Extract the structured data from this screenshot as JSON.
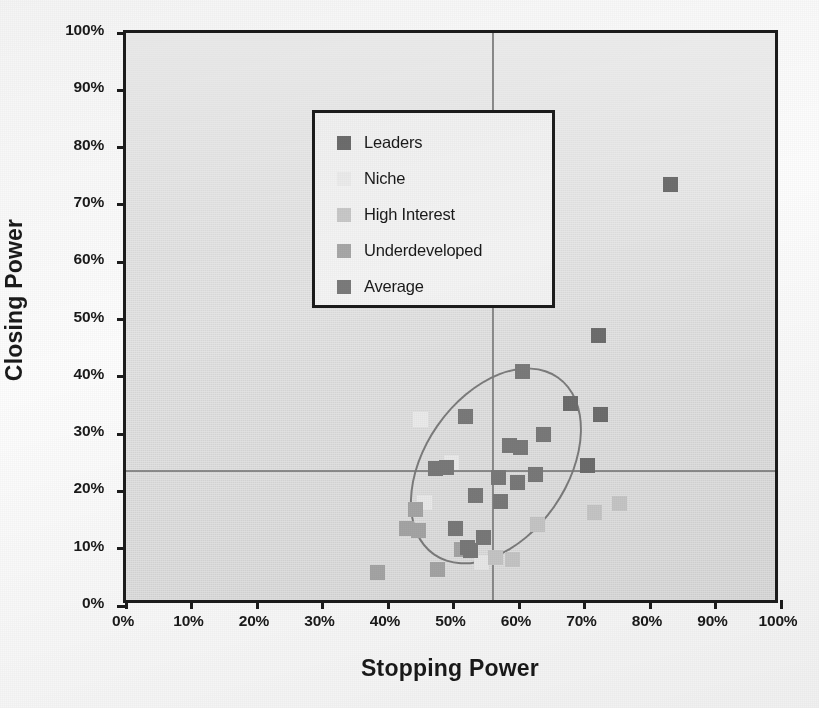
{
  "chart_data": {
    "type": "scatter",
    "title": "",
    "xlabel": "Stopping Power",
    "ylabel": "Closing Power",
    "xlim": [
      0,
      100
    ],
    "ylim": [
      0,
      100
    ],
    "xtick_labels": [
      "0%",
      "10%",
      "20%",
      "30%",
      "40%",
      "50%",
      "60%",
      "70%",
      "80%",
      "90%",
      "100%"
    ],
    "ytick_labels": [
      "0%",
      "10%",
      "20%",
      "30%",
      "40%",
      "50%",
      "60%",
      "70%",
      "80%",
      "90%",
      "100%"
    ],
    "xticks": [
      0,
      10,
      20,
      30,
      40,
      50,
      60,
      70,
      80,
      90,
      100
    ],
    "yticks": [
      0,
      10,
      20,
      30,
      40,
      50,
      60,
      70,
      80,
      90,
      100
    ],
    "grid": false,
    "legend_position": "upper-left-inside",
    "reference_lines": [
      {
        "axis": "vertical",
        "value": 56.0,
        "label": "average stopping power"
      },
      {
        "axis": "horizontal",
        "value": 23.5,
        "label": "average closing power"
      }
    ],
    "annotations": [
      {
        "shape": "ellipse",
        "center_x": 56.5,
        "center_y": 24.5,
        "width": 22.0,
        "height": 38.0,
        "rotation_deg": 35,
        "label": "core cluster highlight"
      }
    ],
    "series": [
      {
        "name": "Leaders",
        "color": "#6e6e6e",
        "points": [
          {
            "x": 60.3,
            "y": 83.8
          },
          {
            "x": 83.2,
            "y": 73.5
          },
          {
            "x": 72.2,
            "y": 47.2
          },
          {
            "x": 67.8,
            "y": 35.3
          },
          {
            "x": 72.4,
            "y": 33.5
          },
          {
            "x": 70.5,
            "y": 24.6
          }
        ]
      },
      {
        "name": "Niche",
        "color": "#ededed",
        "points": [
          {
            "x": 45.0,
            "y": 32.6
          },
          {
            "x": 49.7,
            "y": 25.1
          },
          {
            "x": 45.6,
            "y": 18.1
          },
          {
            "x": 54.2,
            "y": 7.6
          }
        ]
      },
      {
        "name": "High Interest",
        "color": "#c9c9c9",
        "points": [
          {
            "x": 62.8,
            "y": 14.2
          },
          {
            "x": 71.6,
            "y": 16.3
          },
          {
            "x": 75.4,
            "y": 17.9
          },
          {
            "x": 56.4,
            "y": 8.4
          },
          {
            "x": 59.0,
            "y": 8.2
          }
        ]
      },
      {
        "name": "Underdeveloped",
        "color": "#a8a8a8",
        "points": [
          {
            "x": 38.4,
            "y": 5.8
          },
          {
            "x": 42.8,
            "y": 13.6
          },
          {
            "x": 44.2,
            "y": 16.8
          },
          {
            "x": 44.6,
            "y": 13.2
          },
          {
            "x": 47.6,
            "y": 6.3
          },
          {
            "x": 51.2,
            "y": 9.8
          }
        ]
      },
      {
        "name": "Average",
        "color": "#7b7b7b",
        "points": [
          {
            "x": 60.5,
            "y": 41.0
          },
          {
            "x": 51.8,
            "y": 33.0
          },
          {
            "x": 63.8,
            "y": 30.0
          },
          {
            "x": 58.6,
            "y": 28.0
          },
          {
            "x": 60.2,
            "y": 27.6
          },
          {
            "x": 62.5,
            "y": 23.0
          },
          {
            "x": 56.8,
            "y": 22.4
          },
          {
            "x": 59.8,
            "y": 21.5
          },
          {
            "x": 49.0,
            "y": 24.2
          },
          {
            "x": 47.3,
            "y": 24.0
          },
          {
            "x": 53.4,
            "y": 19.2
          },
          {
            "x": 57.1,
            "y": 18.2
          },
          {
            "x": 50.3,
            "y": 13.5
          },
          {
            "x": 54.6,
            "y": 12.0
          },
          {
            "x": 52.2,
            "y": 10.2
          },
          {
            "x": 52.6,
            "y": 9.6
          }
        ]
      }
    ]
  },
  "legend": {
    "items": [
      {
        "label": "Leaders",
        "color": "#6e6e6e"
      },
      {
        "label": "Niche",
        "color": "#ededed"
      },
      {
        "label": "High Interest",
        "color": "#c9c9c9"
      },
      {
        "label": "Underdeveloped",
        "color": "#a8a8a8"
      },
      {
        "label": "Average",
        "color": "#7b7b7b"
      }
    ]
  },
  "style": {
    "plot_background": "#dedede",
    "axis_color": "#1c1c1c",
    "reference_line_color": "#8c8c8c",
    "ellipse_color": "#7d7d7d"
  }
}
